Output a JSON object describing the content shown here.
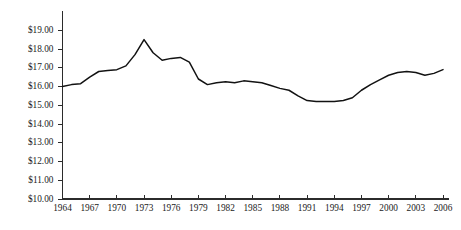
{
  "chart_data": {
    "type": "line",
    "title": "",
    "subtitle": "",
    "xlabel": "",
    "ylabel": "",
    "xlim": [
      1964,
      2006
    ],
    "ylim": [
      10.0,
      19.0
    ],
    "grid": false,
    "legend": null,
    "y_tick_labels": [
      "$19.00",
      "$18.00",
      "$17.00",
      "$16.00",
      "$15.00",
      "$14.00",
      "$13.00",
      "$12.00",
      "$11.00",
      "$10.00"
    ],
    "y_tick_values": [
      19.0,
      18.0,
      17.0,
      16.0,
      15.0,
      14.0,
      13.0,
      12.0,
      11.0,
      10.0
    ],
    "x_tick_labels": [
      "1964",
      "1967",
      "1970",
      "1973",
      "1976",
      "1979",
      "1982",
      "1985",
      "1988",
      "1991",
      "1994",
      "1997",
      "2000",
      "2003",
      "2006"
    ],
    "x_tick_values": [
      1964,
      1967,
      1970,
      1973,
      1976,
      1979,
      1982,
      1985,
      1988,
      1991,
      1994,
      1997,
      2000,
      2003,
      2006
    ],
    "series": [
      {
        "name": "value",
        "color": "#121212",
        "x": [
          1964,
          1965,
          1966,
          1967,
          1968,
          1969,
          1970,
          1971,
          1972,
          1973,
          1974,
          1975,
          1976,
          1977,
          1978,
          1979,
          1980,
          1981,
          1982,
          1983,
          1984,
          1985,
          1986,
          1987,
          1988,
          1989,
          1990,
          1991,
          1992,
          1993,
          1994,
          1995,
          1996,
          1997,
          1998,
          1999,
          2000,
          2001,
          2002,
          2003,
          2004,
          2005,
          2006
        ],
        "values": [
          16.0,
          16.1,
          16.15,
          16.5,
          16.8,
          16.85,
          16.9,
          17.1,
          17.7,
          18.5,
          17.8,
          17.4,
          17.5,
          17.55,
          17.3,
          16.4,
          16.1,
          16.2,
          16.25,
          16.2,
          16.3,
          16.25,
          16.2,
          16.05,
          15.9,
          15.8,
          15.5,
          15.25,
          15.2,
          15.2,
          15.2,
          15.25,
          15.4,
          15.8,
          16.1,
          16.35,
          16.6,
          16.75,
          16.8,
          16.75,
          16.6,
          16.7,
          16.9
        ]
      }
    ]
  }
}
